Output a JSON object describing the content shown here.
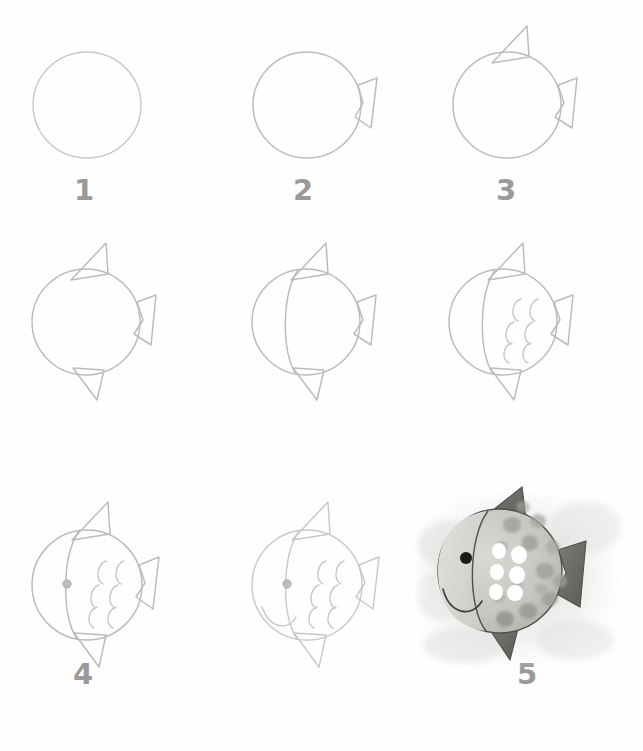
{
  "page": {
    "medium": "pencil sketch and watercolor",
    "total_steps": 9,
    "background_color": "#fefefe",
    "pencil_color": "#b0b0b0",
    "number_color": "#9a9a9a",
    "layout": {
      "columns": 3,
      "rows": 3
    }
  },
  "steps": [
    {
      "number": "1",
      "label": "1",
      "description": "Draw a large circle for the body",
      "elements": [
        "circle"
      ]
    },
    {
      "number": "2",
      "label": "2",
      "description": "Add the tail fin on the right side",
      "elements": [
        "circle",
        "tail-fin"
      ]
    },
    {
      "number": "3",
      "label": "3",
      "description": "Add the dorsal fin on top",
      "elements": [
        "circle",
        "tail-fin",
        "dorsal-fin"
      ]
    },
    {
      "number": "4",
      "label": "4",
      "description": "Add the bottom fin",
      "elements": [
        "circle",
        "tail-fin",
        "dorsal-fin",
        "bottom-fin"
      ]
    },
    {
      "number": "5",
      "label": "5",
      "description": "Draw a curved line to separate the head from the body",
      "elements": [
        "circle",
        "tail-fin",
        "dorsal-fin",
        "bottom-fin",
        "head-line"
      ]
    },
    {
      "number": "6",
      "label": "6",
      "description": "Add the scales as curved arcs",
      "elements": [
        "circle",
        "tail-fin",
        "dorsal-fin",
        "bottom-fin",
        "head-line",
        "scales"
      ]
    },
    {
      "number": "7",
      "label": "7",
      "description": "Add the eye",
      "elements": [
        "circle",
        "tail-fin",
        "dorsal-fin",
        "bottom-fin",
        "head-line",
        "scales",
        "eye"
      ]
    },
    {
      "number": "8",
      "label": "8",
      "description": "Draw the smiling mouth",
      "elements": [
        "circle",
        "tail-fin",
        "dorsal-fin",
        "bottom-fin",
        "head-line",
        "scales",
        "eye",
        "mouth"
      ]
    },
    {
      "number": "9",
      "label": "9",
      "description": "Finished watercolor painting with spots and shiny scales",
      "elements": [
        "painted-fish",
        "watercolor-wash",
        "spots",
        "white-scales",
        "dark-fins",
        "black-eye"
      ]
    }
  ],
  "final_artwork": {
    "body_color": "#c9c9c4",
    "head_color": "#d8d8d4",
    "fin_color": "#6a6a68",
    "spot_color": "#9a9a96",
    "scale_highlight_color": "#ffffff",
    "eye_color": "#1a1a1a",
    "wash_color": "#e2e2de",
    "spot_count": 14,
    "white_scale_count": 6
  }
}
